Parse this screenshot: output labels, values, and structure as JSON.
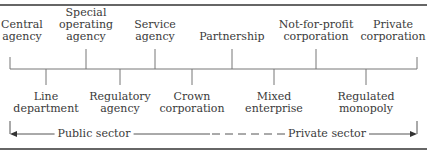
{
  "figure": {
    "caption_fragment": "g",
    "colors": {
      "line": "#555555",
      "rule": "#333333",
      "text": "#3a3a3a"
    }
  },
  "upper_labels": [
    {
      "text": "Central agency",
      "lines": [
        "Central",
        "agency"
      ],
      "x": 10
    },
    {
      "text": "Special operating agency",
      "lines": [
        "Special",
        "operating",
        "agency"
      ],
      "x": 86
    },
    {
      "text": "Service agency",
      "lines": [
        "Service",
        "agency"
      ],
      "x": 155
    },
    {
      "text": "Partnership",
      "lines": [
        "Partnership"
      ],
      "x": 232
    },
    {
      "text": "Not-for-profit corporation",
      "lines": [
        "Not-for-profit",
        "corporation"
      ],
      "x": 316
    },
    {
      "text": "Private corporation",
      "lines": [
        "Private",
        "corporation"
      ],
      "x": 417
    }
  ],
  "lower_labels": [
    {
      "text": "Line department",
      "lines": [
        "Line",
        "department"
      ],
      "x": 46
    },
    {
      "text": "Regulatory agency",
      "lines": [
        "Regulatory",
        "agency"
      ],
      "x": 120
    },
    {
      "text": "Crown corporation",
      "lines": [
        "Crown",
        "corporation"
      ],
      "x": 192
    },
    {
      "text": "Mixed enterprise",
      "lines": [
        "Mixed",
        "enterprise"
      ],
      "x": 274
    },
    {
      "text": "Regulated monopoly",
      "lines": [
        "Regulated",
        "monopoly"
      ],
      "x": 366
    }
  ],
  "axis": {
    "left_label": "Public sector",
    "right_label": "Private sector",
    "left_arrow": "arrow-left",
    "right_arrow": "arrow-right"
  }
}
